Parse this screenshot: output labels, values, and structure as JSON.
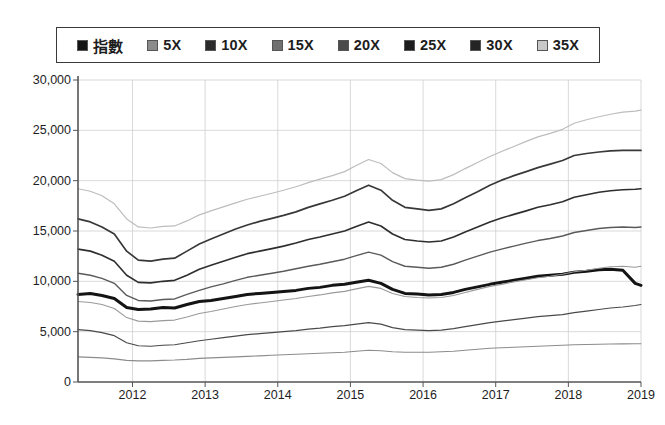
{
  "chart_data": {
    "type": "line",
    "title": "",
    "xlabel": "",
    "ylabel": "",
    "xlim": [
      2011.25,
      2019.0
    ],
    "ylim": [
      0,
      30000
    ],
    "ytick_labels": [
      "0",
      "5,000",
      "10,000",
      "15,000",
      "20,000",
      "25,000",
      "30,000"
    ],
    "yticks": [
      0,
      5000,
      10000,
      15000,
      20000,
      25000,
      30000
    ],
    "xtick_labels": [
      "2012",
      "2013",
      "2014",
      "2015",
      "2016",
      "2017",
      "2018",
      "2019"
    ],
    "xticks": [
      2012,
      2013,
      2014,
      2015,
      2016,
      2017,
      2018,
      2019
    ],
    "grid": true,
    "legend_position": "top",
    "x": [
      2011.25,
      2011.42,
      2011.58,
      2011.75,
      2011.92,
      2012.08,
      2012.25,
      2012.42,
      2012.58,
      2012.75,
      2012.92,
      2013.08,
      2013.25,
      2013.42,
      2013.58,
      2013.75,
      2013.92,
      2014.08,
      2014.25,
      2014.42,
      2014.58,
      2014.75,
      2014.92,
      2015.08,
      2015.25,
      2015.42,
      2015.58,
      2015.75,
      2015.92,
      2016.08,
      2016.25,
      2016.42,
      2016.58,
      2016.75,
      2016.92,
      2017.08,
      2017.25,
      2017.42,
      2017.58,
      2017.75,
      2017.92,
      2018.08,
      2018.25,
      2018.42,
      2018.58,
      2018.75,
      2018.92,
      2019.0
    ],
    "series": [
      {
        "name": "指數",
        "color": "#141414",
        "width": 3.0,
        "values": [
          8700,
          8800,
          8600,
          8300,
          7400,
          7200,
          7250,
          7400,
          7350,
          7700,
          8000,
          8100,
          8300,
          8500,
          8700,
          8800,
          8900,
          9000,
          9100,
          9300,
          9400,
          9600,
          9700,
          9900,
          10100,
          9800,
          9200,
          8800,
          8750,
          8650,
          8700,
          8900,
          9200,
          9450,
          9700,
          9900,
          10100,
          10300,
          10500,
          10600,
          10700,
          10900,
          11000,
          11150,
          11200,
          11100,
          9800,
          9600
        ]
      },
      {
        "name": "5X",
        "color": "#8c8c8c",
        "width": 1.1,
        "values": [
          2500,
          2450,
          2400,
          2300,
          2150,
          2100,
          2100,
          2150,
          2180,
          2250,
          2350,
          2400,
          2450,
          2500,
          2550,
          2600,
          2650,
          2700,
          2750,
          2800,
          2850,
          2900,
          2950,
          3050,
          3150,
          3100,
          3000,
          2950,
          2950,
          2950,
          3000,
          3050,
          3150,
          3250,
          3350,
          3400,
          3450,
          3500,
          3550,
          3600,
          3650,
          3700,
          3720,
          3750,
          3780,
          3790,
          3800,
          3800
        ]
      },
      {
        "name": "10X",
        "color": "#4a4a4a",
        "width": 1.2,
        "values": [
          5200,
          5100,
          4900,
          4600,
          3900,
          3600,
          3550,
          3650,
          3700,
          3900,
          4100,
          4250,
          4400,
          4550,
          4700,
          4800,
          4900,
          5000,
          5100,
          5250,
          5350,
          5500,
          5600,
          5750,
          5900,
          5750,
          5400,
          5200,
          5150,
          5100,
          5150,
          5300,
          5500,
          5700,
          5900,
          6050,
          6200,
          6350,
          6500,
          6600,
          6700,
          6900,
          7050,
          7200,
          7350,
          7450,
          7600,
          7700
        ]
      },
      {
        "name": "15X",
        "color": "#9a9a9a",
        "width": 1.1,
        "values": [
          8000,
          7900,
          7700,
          7300,
          6400,
          6050,
          6000,
          6100,
          6150,
          6450,
          6800,
          7000,
          7250,
          7500,
          7700,
          7850,
          8000,
          8150,
          8300,
          8500,
          8650,
          8850,
          9000,
          9250,
          9500,
          9300,
          8800,
          8500,
          8400,
          8350,
          8400,
          8600,
          8900,
          9200,
          9500,
          9700,
          9950,
          10150,
          10350,
          10500,
          10700,
          10950,
          11100,
          11300,
          11450,
          11500,
          11400,
          11500
        ]
      },
      {
        "name": "20X",
        "color": "#5a5a5a",
        "width": 1.4,
        "values": [
          10800,
          10600,
          10300,
          9800,
          8600,
          8100,
          8050,
          8200,
          8250,
          8700,
          9100,
          9450,
          9750,
          10100,
          10400,
          10600,
          10800,
          11000,
          11250,
          11500,
          11700,
          11950,
          12200,
          12550,
          12900,
          12600,
          11950,
          11500,
          11400,
          11300,
          11400,
          11700,
          12100,
          12500,
          12900,
          13200,
          13500,
          13800,
          14050,
          14250,
          14500,
          14850,
          15050,
          15250,
          15350,
          15400,
          15350,
          15400
        ]
      },
      {
        "name": "25X",
        "color": "#2e2e2e",
        "width": 1.6,
        "values": [
          13200,
          13000,
          12600,
          12000,
          10600,
          9900,
          9850,
          10000,
          10100,
          10600,
          11200,
          11600,
          12000,
          12400,
          12750,
          13000,
          13250,
          13500,
          13800,
          14150,
          14400,
          14700,
          15000,
          15450,
          15900,
          15500,
          14700,
          14150,
          14000,
          13900,
          14000,
          14400,
          14900,
          15400,
          15900,
          16300,
          16650,
          17000,
          17350,
          17600,
          17900,
          18350,
          18600,
          18850,
          19000,
          19100,
          19150,
          19200
        ]
      },
      {
        "name": "30X",
        "color": "#383838",
        "width": 1.7,
        "values": [
          16200,
          15900,
          15400,
          14700,
          13000,
          12100,
          12000,
          12200,
          12300,
          13000,
          13700,
          14200,
          14700,
          15200,
          15600,
          15950,
          16250,
          16550,
          16900,
          17350,
          17700,
          18050,
          18450,
          19000,
          19550,
          19050,
          18050,
          17350,
          17200,
          17050,
          17200,
          17700,
          18300,
          18900,
          19550,
          20050,
          20500,
          20900,
          21300,
          21650,
          22000,
          22500,
          22700,
          22850,
          22950,
          23000,
          23000,
          23000
        ]
      },
      {
        "name": "35X",
        "color": "#bdbdbd",
        "width": 1.2,
        "values": [
          19200,
          18950,
          18500,
          17700,
          16200,
          15400,
          15300,
          15450,
          15500,
          16000,
          16600,
          17000,
          17400,
          17800,
          18150,
          18450,
          18750,
          19050,
          19400,
          19800,
          20150,
          20500,
          20900,
          21500,
          22100,
          21700,
          20800,
          20200,
          20050,
          19950,
          20100,
          20600,
          21200,
          21800,
          22400,
          22900,
          23400,
          23900,
          24350,
          24700,
          25100,
          25700,
          26050,
          26350,
          26600,
          26800,
          26900,
          27000
        ]
      }
    ]
  },
  "legend": {
    "items": [
      {
        "label": "指數",
        "swatch_color": "#141414",
        "cjk": true
      },
      {
        "label": "5X",
        "swatch_color": "#8c8c8c",
        "cjk": false
      },
      {
        "label": "10X",
        "swatch_color": "#2a2a2a",
        "cjk": false
      },
      {
        "label": "15X",
        "swatch_color": "#707070",
        "cjk": false
      },
      {
        "label": "20X",
        "swatch_color": "#4a4a4a",
        "cjk": false
      },
      {
        "label": "25X",
        "swatch_color": "#1c1c1c",
        "cjk": false
      },
      {
        "label": "30X",
        "swatch_color": "#242424",
        "cjk": false
      },
      {
        "label": "35X",
        "swatch_color": "#c8c8c8",
        "cjk": false
      }
    ]
  },
  "axes": {
    "grid_color": "#cfcfcf",
    "axis_color": "#555555"
  }
}
